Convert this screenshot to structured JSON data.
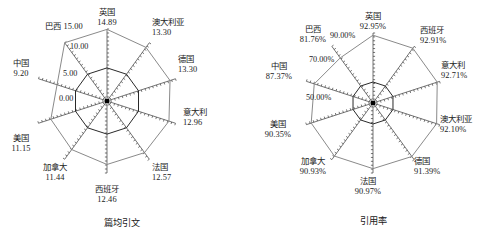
{
  "figure": {
    "panels": [
      {
        "caption": "篇均引文",
        "tick_labels": [
          "0.00",
          "5.00",
          "10.00",
          "15.00"
        ],
        "labels": [
          {
            "name": "英国",
            "value": "14.89"
          },
          {
            "name": "澳大利亚",
            "value": "13.30"
          },
          {
            "name": "德国",
            "value": "13.30"
          },
          {
            "name": "意大利",
            "value": "12.96"
          },
          {
            "name": "法国",
            "value": "12.57"
          },
          {
            "name": "西班牙",
            "value": "12.46"
          },
          {
            "name": "加拿大",
            "value": "11.44"
          },
          {
            "name": "美国",
            "value": "11.15"
          },
          {
            "name": "中国",
            "value": "9.20"
          },
          {
            "name": "巴西",
            "value": "15.00"
          }
        ]
      },
      {
        "caption": "引用率",
        "tick_labels": [
          "50.00%",
          "70.00%",
          "90.00%"
        ],
        "labels": [
          {
            "name": "英国",
            "value": "92.95%"
          },
          {
            "name": "西班牙",
            "value": "92.91%"
          },
          {
            "name": "意大利",
            "value": "92.71%"
          },
          {
            "name": "澳大利亚",
            "value": "92.10%"
          },
          {
            "name": "德国",
            "value": "91.39%"
          },
          {
            "name": "法国",
            "value": "90.97%"
          },
          {
            "name": "加拿大",
            "value": "90.93%"
          },
          {
            "name": "美国",
            "value": "90.35%"
          },
          {
            "name": "中国",
            "value": "87.37%"
          },
          {
            "name": "巴西",
            "value": "81.76%"
          }
        ]
      }
    ]
  },
  "chart_data": [
    {
      "type": "radar",
      "title": "篇均引文",
      "categories": [
        "英国",
        "澳大利亚",
        "德国",
        "意大利",
        "法国",
        "西班牙",
        "加拿大",
        "美国",
        "中国",
        "巴西"
      ],
      "values": [
        14.89,
        13.3,
        13.3,
        12.96,
        12.57,
        12.46,
        11.44,
        11.15,
        9.2,
        15.0
      ],
      "axis_ticks": [
        0.0,
        5.0,
        10.0,
        15.0
      ],
      "axis_tick_labels": [
        "0.00",
        "5.00",
        "10.00",
        "15.00"
      ],
      "rlim": [
        0,
        15
      ],
      "grid": true,
      "legend": "none",
      "xlabel": "篇均引文",
      "ylabel": ""
    },
    {
      "type": "radar",
      "title": "引用率",
      "categories": [
        "英国",
        "西班牙",
        "意大利",
        "澳大利亚",
        "德国",
        "法国",
        "加拿大",
        "美国",
        "中国",
        "巴西"
      ],
      "values": [
        92.95,
        92.91,
        92.71,
        92.1,
        91.39,
        90.97,
        90.93,
        90.35,
        87.37,
        81.76
      ],
      "axis_ticks": [
        50.0,
        70.0,
        90.0
      ],
      "axis_tick_labels": [
        "50.00%",
        "70.00%",
        "90.00%"
      ],
      "rlim": [
        30,
        95
      ],
      "grid": true,
      "legend": "none",
      "xlabel": "引用率",
      "ylabel": ""
    }
  ]
}
